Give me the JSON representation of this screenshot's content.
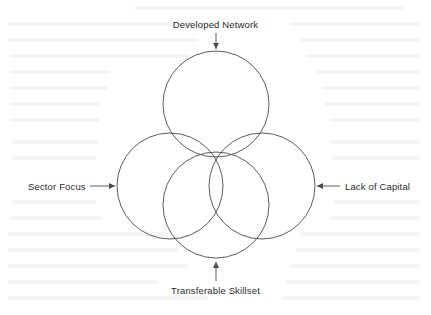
{
  "diagram": {
    "type": "four-circle-venn",
    "title_present": false,
    "background_color": "#ffffff",
    "stroke_color": "#4a4a4a",
    "text_color": "#2b2b2b",
    "labels": {
      "top": "Developed Network",
      "bottom": "Transferable Skillset",
      "left": "Sector Focus",
      "right": "Lack of Capital"
    },
    "arrows": {
      "top": "arrow-down",
      "bottom": "arrow-up",
      "left": "arrow-right",
      "right": "arrow-left"
    },
    "circles": [
      {
        "name": "developed-network-circle",
        "cx": 216,
        "cy": 104,
        "r": 53
      },
      {
        "name": "sector-focus-circle",
        "cx": 170,
        "cy": 186,
        "r": 53
      },
      {
        "name": "lack-of-capital-circle",
        "cx": 262,
        "cy": 186,
        "r": 53
      },
      {
        "name": "transferable-skillset-circle",
        "cx": 216,
        "cy": 205,
        "r": 53
      }
    ]
  }
}
